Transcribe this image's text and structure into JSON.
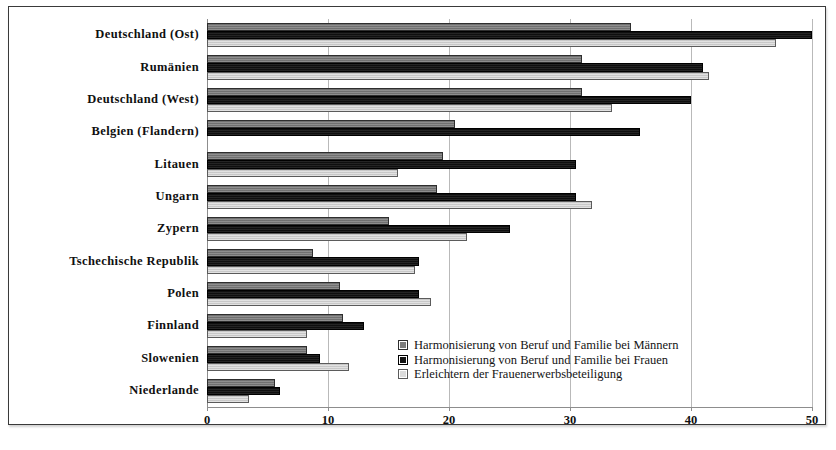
{
  "chart_data": {
    "type": "bar",
    "orientation": "horizontal",
    "title": "",
    "xlabel": "",
    "ylabel": "",
    "xlim": [
      0,
      50
    ],
    "xticks": [
      0,
      10,
      20,
      30,
      40,
      50
    ],
    "xtick_labels": [
      "0",
      "10",
      "20",
      "30",
      "40",
      "50"
    ],
    "grid": true,
    "grid_axis": "x",
    "legend_position": "inside-lower-right",
    "categories": [
      "Deutschland (Ost)",
      "Rumänien",
      "Deutschland (West)",
      "Belgien (Flandern)",
      "Litauen",
      "Ungarn",
      "Zypern",
      "Tschechische Republik",
      "Polen",
      "Finnland",
      "Slowenien",
      "Niederlande"
    ],
    "series": [
      {
        "name": "Harmonisierung von Beruf und Familie bei Männern",
        "color": "#7d7d7d",
        "values": [
          35.0,
          31.0,
          31.0,
          20.5,
          19.5,
          19.0,
          15.0,
          8.8,
          11.0,
          11.2,
          8.3,
          5.6
        ]
      },
      {
        "name": "Harmonisierung von Beruf und Familie bei Frauen",
        "color": "#141414",
        "values": [
          50.0,
          41.0,
          40.0,
          35.8,
          30.5,
          30.5,
          25.0,
          17.5,
          17.5,
          13.0,
          9.3,
          6.0
        ]
      },
      {
        "name": "Erleichtern der Frauenerwerbsbeteiligung",
        "color": "#d3d3d3",
        "values": [
          47.0,
          41.5,
          33.5,
          0.0,
          15.8,
          31.8,
          21.5,
          17.2,
          18.5,
          8.3,
          11.7,
          3.5
        ]
      }
    ]
  }
}
